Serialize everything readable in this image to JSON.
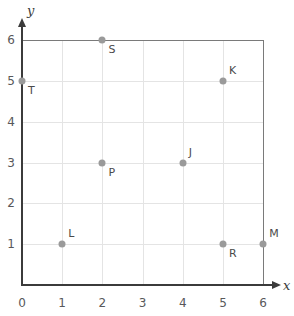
{
  "chart_data": {
    "type": "scatter",
    "title": "",
    "xlabel": "x",
    "ylabel": "y",
    "xlim": [
      0,
      6
    ],
    "ylim": [
      0,
      6
    ],
    "grid": true,
    "legend": "none",
    "xticks": [
      "0",
      "1",
      "2",
      "3",
      "4",
      "5",
      "6"
    ],
    "yticks": [
      "0",
      "1",
      "2",
      "3",
      "4",
      "5",
      "6"
    ],
    "points": [
      {
        "label": "S",
        "x": 2,
        "y": 6,
        "label_pos": "below-right"
      },
      {
        "label": "T",
        "x": 0,
        "y": 5,
        "label_pos": "below-right"
      },
      {
        "label": "K",
        "x": 5,
        "y": 5,
        "label_pos": "above-right"
      },
      {
        "label": "P",
        "x": 2,
        "y": 3,
        "label_pos": "below-right"
      },
      {
        "label": "J",
        "x": 4,
        "y": 3,
        "label_pos": "above-right"
      },
      {
        "label": "L",
        "x": 1,
        "y": 1,
        "label_pos": "above-right"
      },
      {
        "label": "R",
        "x": 5,
        "y": 1,
        "label_pos": "below-right"
      },
      {
        "label": "M",
        "x": 6,
        "y": 1,
        "label_pos": "above-right"
      }
    ]
  },
  "colors": {
    "point": "#9a9a9a",
    "axis": "#3b3b3b",
    "grid": "#e4e4e4",
    "frame": "#7a7a7a",
    "tick_text": "#58585a",
    "label_text": "#4a4a4a"
  }
}
